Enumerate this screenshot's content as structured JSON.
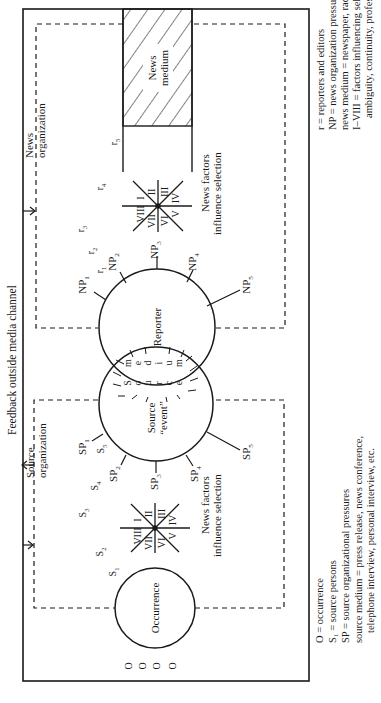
{
  "figure": {
    "feedback_label": "Feedback outside media channel",
    "news_org_label": [
      "News",
      "organization"
    ],
    "source_org_label": [
      "Source",
      "organization"
    ],
    "news_medium_label": [
      "News",
      "medium"
    ],
    "reporter_label": "Reporter",
    "source_event_label": [
      "Source",
      "“event”"
    ],
    "occurrence_label": "Occurrence",
    "source_medium_letters": [
      "S",
      "o",
      "u",
      "r",
      "c",
      "e",
      "m",
      "e",
      "d",
      "i",
      "u",
      "m"
    ],
    "news_factors_label": [
      "News factors",
      "influence selection"
    ],
    "source_factors_label": [
      "News factors",
      "influence selection"
    ],
    "roman_numerals": [
      "I",
      "II",
      "III",
      "IV",
      "V",
      "VI",
      "VII",
      "VIII"
    ],
    "occurrence_markers": [
      "O",
      "O",
      "O",
      "O"
    ],
    "np_labels": [
      {
        "base": "NP",
        "sub": "1"
      },
      {
        "base": "NP",
        "sub": "2"
      },
      {
        "base": "NP",
        "sub": "3"
      },
      {
        "base": "NP",
        "sub": "4"
      },
      {
        "base": "NP",
        "sub": "5"
      }
    ],
    "sp_labels": [
      {
        "base": "SP",
        "sub": "1"
      },
      {
        "base": "SP",
        "sub": "2"
      },
      {
        "base": "SP",
        "sub": "3"
      },
      {
        "base": "SP",
        "sub": "4"
      },
      {
        "base": "SP",
        "sub": "5"
      }
    ],
    "r_labels": [
      {
        "base": "r",
        "sub": "1"
      },
      {
        "base": "r",
        "sub": "2"
      },
      {
        "base": "r",
        "sub": "3"
      },
      {
        "base": "r",
        "sub": "4"
      },
      {
        "base": "r",
        "sub": "5"
      }
    ],
    "s_labels": [
      {
        "base": "S",
        "sub": "1"
      },
      {
        "base": "S",
        "sub": "2"
      },
      {
        "base": "S",
        "sub": "3"
      },
      {
        "base": "S",
        "sub": "4"
      },
      {
        "base": "S",
        "sub": "5"
      }
    ]
  },
  "legend_news": [
    {
      "key": "r",
      "value": "reporters and editors"
    },
    {
      "key": "NP",
      "value": "news organization pressures"
    },
    {
      "key": "news medium",
      "value": "newspaper, radio, television"
    },
    {
      "key": "I–VIII",
      "value": "factors influencing selection (timing, space,"
    },
    {
      "key": "",
      "value": "ambiguity, continuity, professional values, etc.)"
    }
  ],
  "legend_source": [
    {
      "key": "O",
      "value": "occurrence"
    },
    {
      "key": "S₁",
      "value": "source persons"
    },
    {
      "key": "SP",
      "value": "source organizational pressures"
    },
    {
      "key": "source medium",
      "value": "press release, news conference,"
    },
    {
      "key": "",
      "value": "telephone interview, personal interview, etc."
    }
  ],
  "colors": {
    "ink": "#1a1a1a",
    "background": "#ffffff"
  }
}
